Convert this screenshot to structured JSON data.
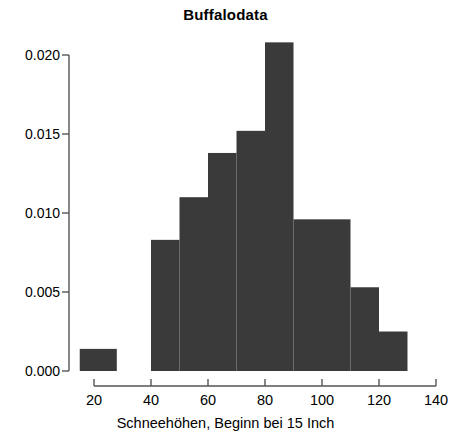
{
  "chart_data": {
    "type": "bar",
    "title": "Buffalodata",
    "subtitle": "",
    "xlabel": "Schneehöhen, Beginn bei 15 Inch",
    "ylabel": "",
    "xlim": [
      13,
      137
    ],
    "ylim": [
      0.0,
      0.0205
    ],
    "grid": false,
    "legend": null,
    "bar_color": "#3a3a3a",
    "axis_color": "#555555",
    "bin_edges": [
      15,
      28,
      40,
      50,
      60,
      70,
      80,
      90,
      100,
      110,
      120,
      130
    ],
    "categories": [
      "15–28",
      "40–50",
      "50–60",
      "60–70",
      "70–80",
      "80–90",
      "90–100",
      "100–110",
      "110–120",
      "120–130"
    ],
    "bars": [
      {
        "label": "15–28",
        "x0": 15,
        "x1": 28,
        "value": 0.0014
      },
      {
        "label": "40–50",
        "x0": 40,
        "x1": 50,
        "value": 0.0083
      },
      {
        "label": "50–60",
        "x0": 50,
        "x1": 60,
        "value": 0.011
      },
      {
        "label": "60–70",
        "x0": 60,
        "x1": 70,
        "value": 0.0138
      },
      {
        "label": "70–80",
        "x0": 70,
        "x1": 80,
        "value": 0.0152
      },
      {
        "label": "80–90",
        "x0": 80,
        "x1": 90,
        "value": 0.0208
      },
      {
        "label": "90–100",
        "x0": 90,
        "x1": 100,
        "value": 0.0096
      },
      {
        "label": "100–110",
        "x0": 100,
        "x1": 110,
        "value": 0.0096
      },
      {
        "label": "110–120",
        "x0": 110,
        "x1": 120,
        "value": 0.0053
      },
      {
        "label": "120–130",
        "x0": 120,
        "x1": 130,
        "value": 0.0025
      }
    ],
    "values": [
      0.0014,
      0.0083,
      0.011,
      0.0138,
      0.0152,
      0.0208,
      0.0096,
      0.0096,
      0.0053,
      0.0025
    ],
    "yticks": [
      0.0,
      0.005,
      0.01,
      0.015,
      0.02
    ],
    "ytick_labels": [
      "0.000",
      "0.005",
      "0.010",
      "0.015",
      "0.020"
    ],
    "xticks": [
      20,
      40,
      60,
      80,
      100,
      120,
      140
    ],
    "xtick_labels": [
      "20",
      "40",
      "60",
      "80",
      "100",
      "120",
      "140"
    ]
  }
}
